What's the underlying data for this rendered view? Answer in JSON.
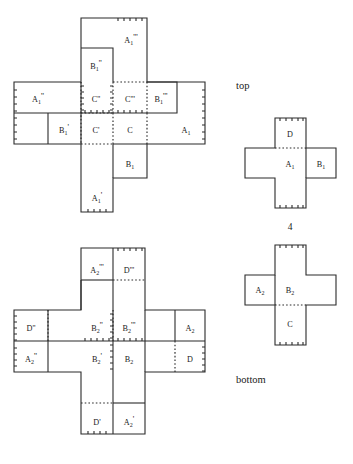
{
  "figure": {
    "title": "",
    "annotations": {
      "top_label": "top",
      "bottom_label": "bottom",
      "count_label": "4"
    },
    "panels": [
      {
        "id": "top-left-net",
        "name": "upper-left-unfolded-net",
        "faces": [
          {
            "id": "a1ppp",
            "base": "A",
            "sub": "1",
            "primes": "'''"
          },
          {
            "id": "b1pp",
            "base": "B",
            "sub": "1",
            "primes": "''"
          },
          {
            "id": "a1pp",
            "base": "A",
            "sub": "1",
            "primes": "''"
          },
          {
            "id": "cpp",
            "base": "C",
            "sub": "",
            "primes": "''"
          },
          {
            "id": "cppp",
            "base": "C",
            "sub": "",
            "primes": "'''"
          },
          {
            "id": "b1ppp",
            "base": "B",
            "sub": "1",
            "primes": "'''"
          },
          {
            "id": "b1p",
            "base": "B",
            "sub": "1",
            "primes": "'"
          },
          {
            "id": "cp",
            "base": "C",
            "sub": "",
            "primes": "'"
          },
          {
            "id": "c",
            "base": "C",
            "sub": "",
            "primes": ""
          },
          {
            "id": "a1",
            "base": "A",
            "sub": "1",
            "primes": ""
          },
          {
            "id": "b1",
            "base": "B",
            "sub": "1",
            "primes": ""
          },
          {
            "id": "a1p",
            "base": "A",
            "sub": "1",
            "primes": "'"
          }
        ]
      },
      {
        "id": "bottom-left-net",
        "name": "lower-left-unfolded-net",
        "faces": [
          {
            "id": "a2ppp",
            "base": "A",
            "sub": "2",
            "primes": "'''"
          },
          {
            "id": "dppp",
            "base": "D",
            "sub": "",
            "primes": "'''"
          },
          {
            "id": "dpp",
            "base": "D",
            "sub": "",
            "primes": "''"
          },
          {
            "id": "b2pp",
            "base": "B",
            "sub": "2",
            "primes": "''"
          },
          {
            "id": "b2ppp",
            "base": "B",
            "sub": "2",
            "primes": "'''"
          },
          {
            "id": "a2",
            "base": "A",
            "sub": "2",
            "primes": ""
          },
          {
            "id": "a2pp",
            "base": "A",
            "sub": "2",
            "primes": "''"
          },
          {
            "id": "b2p",
            "base": "B",
            "sub": "2",
            "primes": "'"
          },
          {
            "id": "b2",
            "base": "B",
            "sub": "2",
            "primes": ""
          },
          {
            "id": "d",
            "base": "D",
            "sub": "",
            "primes": ""
          },
          {
            "id": "dp",
            "base": "D",
            "sub": "",
            "primes": "'"
          },
          {
            "id": "a2p",
            "base": "A",
            "sub": "2",
            "primes": "'"
          }
        ]
      },
      {
        "id": "top-right-cross",
        "name": "upper-right-cross-net",
        "faces": [
          {
            "id": "d_t",
            "base": "D",
            "sub": "",
            "primes": ""
          },
          {
            "id": "a1_t",
            "base": "A",
            "sub": "1",
            "primes": ""
          },
          {
            "id": "b1_t",
            "base": "B",
            "sub": "1",
            "primes": ""
          }
        ]
      },
      {
        "id": "bottom-right-cross",
        "name": "lower-right-cross-net",
        "faces": [
          {
            "id": "a2_b",
            "base": "A",
            "sub": "2",
            "primes": ""
          },
          {
            "id": "b2_b",
            "base": "B",
            "sub": "2",
            "primes": ""
          },
          {
            "id": "c_b",
            "base": "C",
            "sub": "",
            "primes": ""
          }
        ]
      }
    ]
  }
}
